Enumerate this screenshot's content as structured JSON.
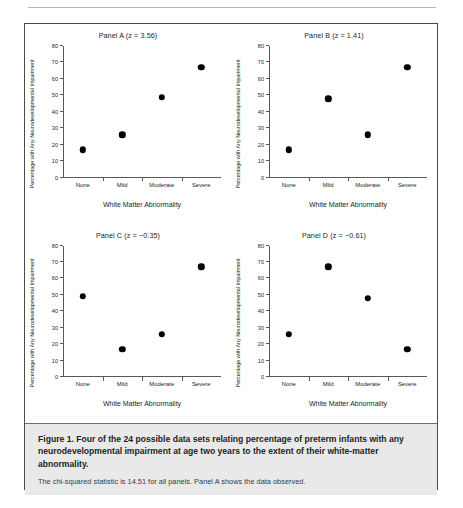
{
  "figure": {
    "caption_title": "Figure 1. Four of the 24 possible data sets relating percentage of preterm infants with any neurodevelopmental impairment at age two years to the extent of their white-matter abnormality.",
    "caption_note": "The chi-squared statistic is 14.51 for all panels. Panel A shows the data observed."
  },
  "chart_data": [
    {
      "type": "scatter",
      "title": "Panel A (z = 3.56)",
      "xlabel": "White Matter Abnormality",
      "ylabel": "Percentage with Any Neurodevelopmental Impairment",
      "categories": [
        "None",
        "Mild",
        "Moderate",
        "Severe"
      ],
      "values": [
        17,
        26,
        49,
        67
      ],
      "ylim": [
        0,
        80
      ],
      "yticks": [
        0,
        10,
        20,
        30,
        40,
        50,
        60,
        70,
        80
      ],
      "grid": false,
      "legend": "none",
      "z": 3.56
    },
    {
      "type": "scatter",
      "title": "Panel B (z = 1.41)",
      "xlabel": "White Matter Abnormality",
      "ylabel": "Percentage with Any Neurodevelopmental Impairment",
      "categories": [
        "None",
        "Mild",
        "Moderate",
        "Severe"
      ],
      "values": [
        17,
        48,
        26,
        67
      ],
      "ylim": [
        0,
        80
      ],
      "yticks": [
        0,
        10,
        20,
        30,
        40,
        50,
        60,
        70,
        80
      ],
      "grid": false,
      "legend": "none",
      "z": 1.41
    },
    {
      "type": "scatter",
      "title": "Panel C (z = −0.35)",
      "xlabel": "White Matter Abnormality",
      "ylabel": "Percentage with Any Neurodevelopmental Impairment",
      "categories": [
        "None",
        "Mild",
        "Moderate",
        "Severe"
      ],
      "values": [
        49,
        17,
        26,
        67
      ],
      "ylim": [
        0,
        80
      ],
      "yticks": [
        0,
        10,
        20,
        30,
        40,
        50,
        60,
        70,
        80
      ],
      "grid": false,
      "legend": "none",
      "z": -0.35
    },
    {
      "type": "scatter",
      "title": "Panel D (z = −0.61)",
      "xlabel": "White Matter Abnormality",
      "ylabel": "Percentage with Any Neurodevelopmental Impairment",
      "categories": [
        "None",
        "Mild",
        "Moderate",
        "Severe"
      ],
      "values": [
        26,
        67,
        48,
        17
      ],
      "ylim": [
        0,
        80
      ],
      "yticks": [
        0,
        10,
        20,
        30,
        40,
        50,
        60,
        70,
        80
      ],
      "grid": false,
      "legend": "none",
      "z": -0.61
    }
  ]
}
